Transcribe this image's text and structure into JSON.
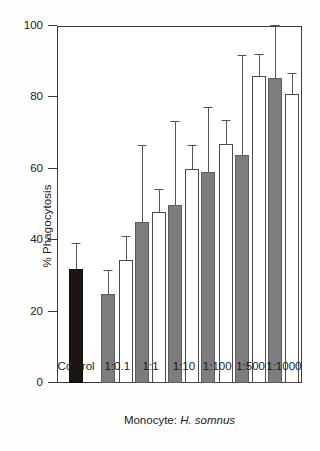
{
  "chart_data": {
    "type": "bar",
    "title": "",
    "xlabel": "Monocyte: H. somnus",
    "xlabel_prefix": "Monocyte: ",
    "xlabel_species": "H. somnus",
    "ylabel": "% Phagocytosis",
    "ylim": [
      0,
      100
    ],
    "yticks": [
      0,
      20,
      40,
      60,
      80,
      100
    ],
    "ytick_labels": [
      "0",
      "20",
      "40",
      "60",
      "80",
      "100"
    ],
    "grid": false,
    "legend": "none",
    "categories": [
      "Control",
      "1:0.1",
      "1:1",
      "1:10",
      "1:100",
      "1:500",
      "1:1000"
    ],
    "series": [
      {
        "name": "control",
        "fill": "#1c1410",
        "values": [
          32,
          null,
          null,
          null,
          null,
          null,
          null
        ],
        "errors_upper": [
          39,
          null,
          null,
          null,
          null,
          null,
          null
        ]
      },
      {
        "name": "gray",
        "fill": "#7d7d7d",
        "values": [
          null,
          25,
          45,
          50,
          59,
          64,
          85.5
        ],
        "errors_upper": [
          null,
          31.5,
          66.5,
          73,
          77,
          91.5,
          100
        ]
      },
      {
        "name": "white",
        "fill": "#ffffff",
        "values": [
          null,
          34.5,
          48,
          60,
          67,
          86,
          81
        ],
        "errors_upper": [
          null,
          41,
          54,
          66.5,
          73.5,
          92,
          86.5
        ]
      }
    ]
  },
  "bars": [
    {
      "label": "Control",
      "group": 0,
      "style": "black",
      "value": 32,
      "error_top": 39,
      "center_pct": 7.8
    },
    {
      "label": "1:0.1 gray",
      "group": 1,
      "style": "gray",
      "value": 25,
      "error_top": 31.5,
      "center_pct": 21.0
    },
    {
      "label": "1:0.1 white",
      "group": 1,
      "style": "white",
      "value": 34.5,
      "error_top": 41,
      "center_pct": 28.1
    },
    {
      "label": "1:1 gray",
      "group": 2,
      "style": "gray",
      "value": 45,
      "error_top": 66.5,
      "center_pct": 34.6
    },
    {
      "label": "1:1 white",
      "group": 2,
      "style": "white",
      "value": 48,
      "error_top": 54,
      "center_pct": 41.7
    },
    {
      "label": "1:10 gray",
      "group": 3,
      "style": "gray",
      "value": 50,
      "error_top": 73,
      "center_pct": 48.2
    },
    {
      "label": "1:10 white",
      "group": 3,
      "style": "white",
      "value": 60,
      "error_top": 66.5,
      "center_pct": 55.3
    },
    {
      "label": "1:100 gray",
      "group": 4,
      "style": "gray",
      "value": 59,
      "error_top": 77,
      "center_pct": 61.8
    },
    {
      "label": "1:100 white",
      "group": 4,
      "style": "white",
      "value": 67,
      "error_top": 73.5,
      "center_pct": 68.9
    },
    {
      "label": "1:500 gray",
      "group": 5,
      "style": "gray",
      "value": 64,
      "error_top": 91.5,
      "center_pct": 75.4
    },
    {
      "label": "1:500 white",
      "group": 5,
      "style": "white",
      "value": 86,
      "error_top": 92,
      "center_pct": 82.5
    },
    {
      "label": "1:1000 gray",
      "group": 6,
      "style": "gray",
      "value": 85.5,
      "error_top": 100,
      "center_pct": 89.0
    },
    {
      "label": "1:1000 white",
      "group": 6,
      "style": "white",
      "value": 81,
      "error_top": 86.5,
      "center_pct": 96.1
    }
  ],
  "xtick_positions_pct": [
    7.8,
    24.6,
    38.2,
    51.8,
    65.4,
    79.0,
    92.6
  ]
}
